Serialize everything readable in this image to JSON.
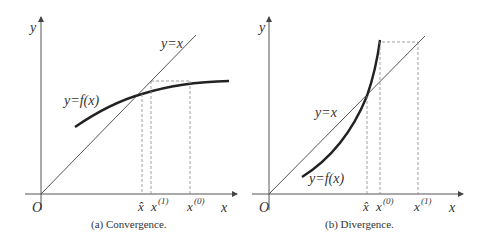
{
  "panels": [
    {
      "id": "a",
      "caption": "(a) Convergence.",
      "axis_x_label": "x",
      "axis_y_label": "y",
      "origin_label": "O",
      "line_label": "y=x",
      "curve_label": "y=f(x)",
      "tick_labels": [
        "x̂",
        "x",
        "(1)",
        "x",
        "(0)"
      ]
    },
    {
      "id": "b",
      "caption": "(b) Divergence.",
      "axis_x_label": "x",
      "axis_y_label": "y",
      "origin_label": "O",
      "line_label": "y=x",
      "curve_label": "y=f(x)",
      "tick_labels": [
        "x̂",
        "x",
        "(0)",
        "x",
        "(1)"
      ]
    }
  ],
  "colors": {
    "axis": "#555555",
    "curve": "#222222",
    "dashed": "#888888"
  }
}
